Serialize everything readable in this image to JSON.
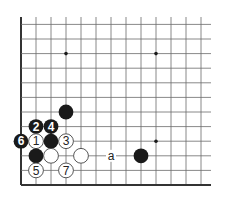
{
  "diagram": {
    "type": "go-board-fragment",
    "corner": "bottom-left",
    "colors": {
      "background": "#ffffff",
      "line": "#6a6a6a",
      "edge": "#333333",
      "black_stone": "#1a1a1a",
      "white_stone": "#ffffff",
      "white_stone_outline": "#444444",
      "star": "#1a1a1a"
    },
    "grid": {
      "origin_x": 21,
      "origin_y": 185,
      "dx": 15,
      "dy": 14.6,
      "visible_cols": 13,
      "visible_rows": 12,
      "line_end_x": 211,
      "line_end_y": 17
    },
    "star_points": [
      {
        "col": 4,
        "row": 10
      },
      {
        "col": 10,
        "row": 10
      },
      {
        "col": 10,
        "row": 4
      }
    ],
    "stones": [
      {
        "color": "black",
        "col": 4,
        "row": 6,
        "label": ""
      },
      {
        "color": "black",
        "col": 2,
        "row": 5,
        "label": "2"
      },
      {
        "color": "black",
        "col": 3,
        "row": 5,
        "label": "4"
      },
      {
        "color": "black",
        "col": 1,
        "row": 4,
        "label": "6"
      },
      {
        "color": "white",
        "col": 2,
        "row": 4,
        "label": "1"
      },
      {
        "color": "black",
        "col": 3,
        "row": 4,
        "label": ""
      },
      {
        "color": "white",
        "col": 4,
        "row": 4,
        "label": "3"
      },
      {
        "color": "black",
        "col": 2,
        "row": 3,
        "label": ""
      },
      {
        "color": "white",
        "col": 3,
        "row": 3,
        "label": ""
      },
      {
        "color": "white",
        "col": 5,
        "row": 3,
        "label": ""
      },
      {
        "color": "black",
        "col": 9,
        "row": 3,
        "label": ""
      },
      {
        "color": "white",
        "col": 2,
        "row": 2,
        "label": "5"
      },
      {
        "color": "white",
        "col": 4,
        "row": 2,
        "label": "7"
      }
    ],
    "markers": [
      {
        "col": 7,
        "row": 3,
        "label": "a"
      }
    ]
  }
}
